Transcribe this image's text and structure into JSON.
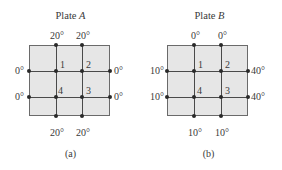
{
  "figure": {
    "panels": [
      {
        "id": "a",
        "title_prefix": "Plate ",
        "title_var": "A",
        "caption": "(a)",
        "top_temps": [
          "20°",
          "20°"
        ],
        "bottom_temps": [
          "20°",
          "20°"
        ],
        "left_temps": [
          "0°",
          "0°"
        ],
        "right_temps": [
          "0°",
          "0°"
        ],
        "nodes": [
          "1",
          "2",
          "3",
          "4"
        ]
      },
      {
        "id": "b",
        "title_prefix": "Plate ",
        "title_var": "B",
        "caption": "(b)",
        "top_temps": [
          "0°",
          "0°"
        ],
        "bottom_temps": [
          "10°",
          "10°"
        ],
        "left_temps": [
          "10°",
          "10°"
        ],
        "right_temps": [
          "40°",
          "40°"
        ],
        "nodes": [
          "1",
          "2",
          "3",
          "4"
        ]
      }
    ],
    "colors": {
      "plate_fill": "#e6e6e6",
      "grid_line": "#4a4a4a",
      "node_dot": "#2a2a2a",
      "text": "#3a3a3a"
    }
  }
}
